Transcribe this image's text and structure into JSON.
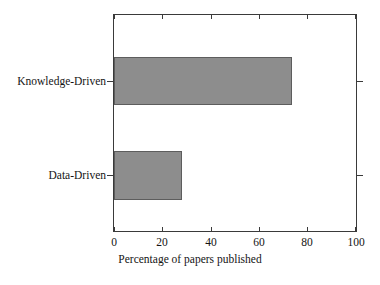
{
  "chart_data": {
    "type": "bar",
    "orientation": "horizontal",
    "title": "",
    "subtitle": "",
    "xlabel": "Percentage of papers published",
    "ylabel": "",
    "categories": [
      "Knowledge-Driven",
      "Data-Driven"
    ],
    "values": [
      73,
      28
    ],
    "series": [
      {
        "name": "Percentage of papers published",
        "values": [
          73,
          28
        ]
      }
    ],
    "xlim": [
      0,
      100
    ],
    "xticks": [
      0,
      20,
      40,
      60,
      80,
      100
    ],
    "xtick_labels": [
      "0",
      "20",
      "40",
      "60",
      "80",
      "100"
    ],
    "ytick_labels": [
      "Knowledge-Driven",
      "Data-Driven"
    ],
    "grid": false,
    "legend": false,
    "legend_position": "none",
    "annotations": [],
    "colors": {
      "bar_fill": "#8d8d8d",
      "bar_edge": "#5d5d5d",
      "axis": "#3a3a3a",
      "text": "#141414",
      "background": "#ffffff"
    }
  }
}
